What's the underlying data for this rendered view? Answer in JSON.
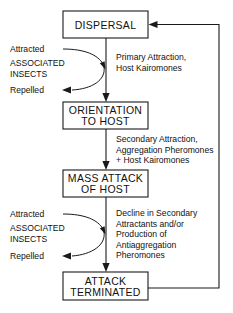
{
  "diagram": {
    "nodes": [
      {
        "id": "dispersal",
        "label": "DISPERSAL"
      },
      {
        "id": "orientation",
        "label_line1": "ORIENTATION",
        "label_line2": "TO HOST"
      },
      {
        "id": "mass_attack",
        "label_line1": "MASS  ATTACK",
        "label_line2": "OF  HOST"
      },
      {
        "id": "attack_terminated",
        "label_line1": "ATTACK",
        "label_line2": "TERMINATED"
      }
    ],
    "edge_labels": {
      "dispersal_to_orientation": {
        "line1": "Primary Attraction,",
        "line2": "Host Kairomones"
      },
      "orientation_to_mass_attack": {
        "line1": "Secondary Attraction,",
        "line2": "Aggregation Pheromones",
        "line3": "+ Host Kairomones"
      },
      "mass_attack_to_terminated": {
        "line1": "Decline in Secondary",
        "line2": "Attractants and/or",
        "line3": "Production of",
        "line4": "Antiaggregation",
        "line5": "Pheromones"
      }
    },
    "side_groups": [
      {
        "id": "associated-insects-upper",
        "attracted": "Attracted",
        "name_line1": "ASSOCIATED",
        "name_line2": "INSECTS",
        "repelled": "Repelled"
      },
      {
        "id": "associated-insects-lower",
        "attracted": "Attracted",
        "name_line1": "ASSOCIATED",
        "name_line2": "INSECTS",
        "repelled": "Repelled"
      }
    ],
    "colors": {
      "stroke": "#1a1a1a",
      "text": "#111111",
      "background": "#ffffff"
    }
  }
}
